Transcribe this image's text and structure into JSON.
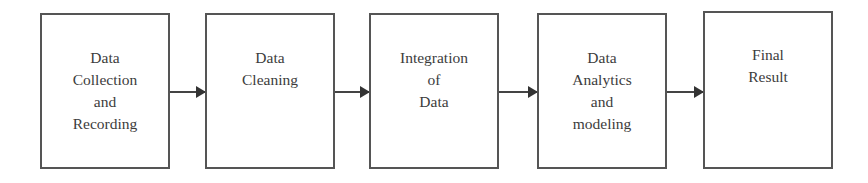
{
  "diagram": {
    "type": "flowchart",
    "direction": "left-to-right",
    "nodes": [
      {
        "id": "step1",
        "lines": [
          "Data",
          "Collection",
          "and",
          "Recording"
        ]
      },
      {
        "id": "step2",
        "lines": [
          "Data",
          "Cleaning"
        ]
      },
      {
        "id": "step3",
        "lines": [
          "Integration",
          "of",
          "Data"
        ]
      },
      {
        "id": "step4",
        "lines": [
          "Data",
          "Analytics",
          "and",
          "modeling"
        ]
      },
      {
        "id": "step5",
        "lines": [
          "Final",
          "Result"
        ]
      }
    ],
    "edges": [
      {
        "from": "step1",
        "to": "step2"
      },
      {
        "from": "step2",
        "to": "step3"
      },
      {
        "from": "step3",
        "to": "step4"
      },
      {
        "from": "step4",
        "to": "step5"
      }
    ],
    "colors": {
      "border": "#555555",
      "text": "#3c3c3c",
      "arrow": "#444444",
      "background": "#ffffff"
    }
  }
}
